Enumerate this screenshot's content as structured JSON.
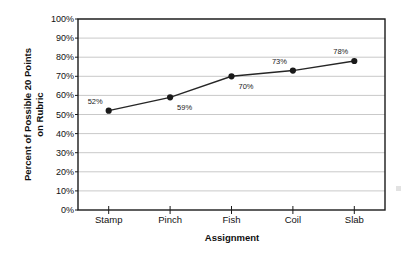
{
  "chart_data": {
    "type": "line",
    "title": "",
    "subtitle": "",
    "xlabel": "Assignment",
    "ylabel": "Percent of Possible 20 Points on Rubric",
    "ylabel_line1": "Percent of Possible 20 Points",
    "ylabel_line2": "on Rubric",
    "categories": [
      "Stamp",
      "Pinch",
      "Fish",
      "Coil",
      "Slab"
    ],
    "values": [
      52,
      59,
      70,
      73,
      78
    ],
    "point_labels": [
      "52%",
      "59%",
      "70%",
      "73%",
      "78%"
    ],
    "label_positions": [
      "above-left",
      "below-right",
      "below-right",
      "above-left",
      "above-left"
    ],
    "ylim": [
      0,
      100
    ],
    "ytick_step": 10,
    "ytick_labels": [
      "100%",
      "90%",
      "80%",
      "70%",
      "60%",
      "50%",
      "40%",
      "30%",
      "20%",
      "10%",
      "0%"
    ],
    "ytick_values": [
      100,
      90,
      80,
      70,
      60,
      50,
      40,
      30,
      20,
      10,
      0
    ],
    "grid": "horizontal",
    "legend": "none",
    "series": [
      {
        "name": "Percent of Possible 20 Points on Rubric",
        "values": [
          52,
          59,
          70,
          73,
          78
        ]
      }
    ]
  },
  "style": {
    "line_color": "#262626",
    "marker_color": "#1a1a1a",
    "grid_color": "#c9c9c9",
    "axis_color": "#1a1a1a",
    "plot_background": "#ffffff",
    "text_color": "#111111"
  }
}
